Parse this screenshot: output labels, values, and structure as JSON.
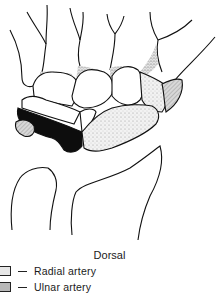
{
  "figure": {
    "view_label": "Dorsal",
    "legend": [
      {
        "label": "Radial artery",
        "fill": "#e6e6e6",
        "pattern": "stipple"
      },
      {
        "label": "Ulnar artery",
        "fill": "#b8b8b8",
        "pattern": "hatch"
      }
    ],
    "colors": {
      "outline": "#111111",
      "radial_stipple": "#dcdcdc",
      "ulnar_black": "#0d0d0d",
      "stipple_dark": "#9a9a9a"
    }
  }
}
